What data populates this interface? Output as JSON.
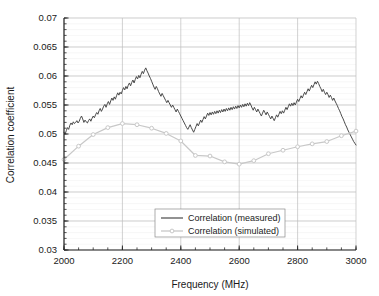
{
  "chart_data": {
    "type": "line",
    "title": "",
    "xlabel": "Frequency (MHz)",
    "ylabel": "Correlation coefficient",
    "xlim": [
      2000,
      3000
    ],
    "ylim": [
      0.03,
      0.07
    ],
    "xticks": [
      2000,
      2200,
      2400,
      2600,
      2800,
      3000
    ],
    "xtick_labels": [
      "2000",
      "2200",
      "2400",
      "2600",
      "2800",
      "3000"
    ],
    "yticks": [
      0.03,
      0.035,
      0.04,
      0.045,
      0.05,
      0.055,
      0.06,
      0.065,
      0.07
    ],
    "ytick_labels": [
      "0.03",
      "0.035",
      "0.04",
      "0.045",
      "0.05",
      "0.055",
      "0.06",
      "0.065",
      "0.07"
    ],
    "grid": true,
    "minor_ticks_y": true,
    "legend_position": "lower center",
    "series": [
      {
        "name": "Correlation (measured)",
        "color": "#4a4a4a",
        "style": "solid",
        "marker": "none",
        "x": [
          2000,
          2004,
          2008,
          2012,
          2016,
          2020,
          2024,
          2028,
          2032,
          2036,
          2040,
          2044,
          2048,
          2052,
          2056,
          2060,
          2064,
          2068,
          2072,
          2076,
          2080,
          2084,
          2088,
          2092,
          2096,
          2100,
          2104,
          2108,
          2112,
          2116,
          2120,
          2124,
          2128,
          2132,
          2136,
          2140,
          2144,
          2148,
          2152,
          2156,
          2160,
          2164,
          2168,
          2172,
          2176,
          2180,
          2184,
          2188,
          2192,
          2196,
          2200,
          2204,
          2208,
          2212,
          2216,
          2220,
          2224,
          2228,
          2232,
          2236,
          2240,
          2244,
          2248,
          2252,
          2256,
          2260,
          2264,
          2268,
          2272,
          2276,
          2280,
          2284,
          2288,
          2292,
          2296,
          2300,
          2304,
          2308,
          2312,
          2316,
          2320,
          2324,
          2328,
          2332,
          2336,
          2340,
          2344,
          2348,
          2352,
          2356,
          2360,
          2364,
          2368,
          2372,
          2376,
          2380,
          2384,
          2388,
          2392,
          2396,
          2400,
          2404,
          2408,
          2412,
          2416,
          2420,
          2424,
          2428,
          2432,
          2436,
          2440,
          2444,
          2448,
          2452,
          2456,
          2460,
          2464,
          2468,
          2472,
          2476,
          2480,
          2484,
          2488,
          2492,
          2496,
          2500,
          2504,
          2508,
          2512,
          2516,
          2520,
          2524,
          2528,
          2532,
          2536,
          2540,
          2544,
          2548,
          2552,
          2556,
          2560,
          2564,
          2568,
          2572,
          2576,
          2580,
          2584,
          2588,
          2592,
          2596,
          2600,
          2604,
          2608,
          2612,
          2616,
          2620,
          2624,
          2628,
          2632,
          2636,
          2640,
          2644,
          2648,
          2652,
          2656,
          2660,
          2664,
          2668,
          2672,
          2676,
          2680,
          2684,
          2688,
          2692,
          2696,
          2700,
          2704,
          2708,
          2712,
          2716,
          2720,
          2724,
          2728,
          2732,
          2736,
          2740,
          2744,
          2748,
          2752,
          2756,
          2760,
          2764,
          2768,
          2772,
          2776,
          2780,
          2784,
          2788,
          2792,
          2796,
          2800,
          2804,
          2808,
          2812,
          2816,
          2820,
          2824,
          2828,
          2832,
          2836,
          2840,
          2844,
          2848,
          2852,
          2856,
          2860,
          2864,
          2868,
          2872,
          2876,
          2880,
          2884,
          2888,
          2892,
          2896,
          2900,
          2904,
          2908,
          2912,
          2916,
          2920,
          2924,
          2928,
          2932,
          2936,
          2940,
          2944,
          2948,
          2952,
          2956,
          2960,
          2964,
          2968,
          2972,
          2976,
          2980,
          2984,
          2988,
          2992,
          2996,
          3000
        ],
        "y": [
          0.0503,
          0.05,
          0.0506,
          0.0511,
          0.0508,
          0.0515,
          0.0519,
          0.0516,
          0.0521,
          0.0518,
          0.052,
          0.0523,
          0.0519,
          0.0522,
          0.0527,
          0.0531,
          0.0526,
          0.052,
          0.0524,
          0.0521,
          0.0519,
          0.0523,
          0.0526,
          0.0522,
          0.0527,
          0.0531,
          0.0528,
          0.0533,
          0.0537,
          0.0534,
          0.054,
          0.0544,
          0.0539,
          0.0543,
          0.0548,
          0.0551,
          0.0546,
          0.0552,
          0.0556,
          0.0551,
          0.0557,
          0.0562,
          0.0558,
          0.0564,
          0.056,
          0.0566,
          0.0571,
          0.0567,
          0.0572,
          0.0569,
          0.0575,
          0.058,
          0.0576,
          0.0582,
          0.0578,
          0.0584,
          0.0588,
          0.0583,
          0.0589,
          0.0593,
          0.0588,
          0.0594,
          0.0599,
          0.0595,
          0.0601,
          0.0597,
          0.0603,
          0.0608,
          0.0604,
          0.061,
          0.0614,
          0.0609,
          0.0605,
          0.06,
          0.0596,
          0.0591,
          0.0586,
          0.0581,
          0.0577,
          0.0582,
          0.0578,
          0.0573,
          0.0569,
          0.0565,
          0.057,
          0.0566,
          0.0562,
          0.0558,
          0.0554,
          0.0558,
          0.0554,
          0.055,
          0.0546,
          0.055,
          0.0546,
          0.0542,
          0.0538,
          0.0543,
          0.0539,
          0.0535,
          0.0531,
          0.0527,
          0.0523,
          0.0519,
          0.0515,
          0.0511,
          0.0508,
          0.0512,
          0.0516,
          0.0511,
          0.0507,
          0.0503,
          0.0508,
          0.0513,
          0.0518,
          0.0514,
          0.0519,
          0.0524,
          0.052,
          0.0525,
          0.053,
          0.0526,
          0.0531,
          0.0536,
          0.0532,
          0.0537,
          0.0533,
          0.0538,
          0.0534,
          0.0539,
          0.0535,
          0.054,
          0.0536,
          0.0541,
          0.0537,
          0.0542,
          0.0538,
          0.0543,
          0.0539,
          0.0544,
          0.054,
          0.0545,
          0.0541,
          0.0546,
          0.0542,
          0.0547,
          0.0543,
          0.0548,
          0.0544,
          0.0549,
          0.0545,
          0.055,
          0.0546,
          0.0551,
          0.0547,
          0.0552,
          0.0548,
          0.0553,
          0.0549,
          0.0554,
          0.055,
          0.0545,
          0.0541,
          0.0546,
          0.0542,
          0.0538,
          0.0543,
          0.0539,
          0.0535,
          0.0531,
          0.0536,
          0.0541,
          0.0537,
          0.0533,
          0.0538,
          0.0534,
          0.053,
          0.0526,
          0.0531,
          0.0527,
          0.0523,
          0.0528,
          0.0533,
          0.0529,
          0.0534,
          0.0539,
          0.0535,
          0.054,
          0.0536,
          0.0541,
          0.0546,
          0.0542,
          0.0547,
          0.0552,
          0.0548,
          0.0553,
          0.0549,
          0.0554,
          0.055,
          0.0555,
          0.056,
          0.0556,
          0.0561,
          0.0566,
          0.0562,
          0.0567,
          0.0572,
          0.0568,
          0.0573,
          0.0578,
          0.0574,
          0.0579,
          0.0584,
          0.058,
          0.0585,
          0.059,
          0.0586,
          0.0591,
          0.0587,
          0.0582,
          0.0578,
          0.0573,
          0.0577,
          0.0572,
          0.0568,
          0.0572,
          0.0568,
          0.0563,
          0.0567,
          0.0563,
          0.0558,
          0.0562,
          0.0557,
          0.0553,
          0.0549,
          0.0544,
          0.054,
          0.0535,
          0.053,
          0.0526,
          0.0521,
          0.0516,
          0.0512,
          0.0507,
          0.0503,
          0.0499,
          0.0495,
          0.0491,
          0.0487,
          0.0484,
          0.0481
        ]
      },
      {
        "name": "Correlation (simulated)",
        "color": "#c8c8c8",
        "style": "solid",
        "marker": "circle",
        "x": [
          2000,
          2050,
          2100,
          2150,
          2200,
          2250,
          2300,
          2350,
          2400,
          2450,
          2500,
          2550,
          2600,
          2650,
          2700,
          2750,
          2800,
          2850,
          2900,
          2950,
          3000
        ],
        "y": [
          0.0456,
          0.0479,
          0.0499,
          0.0511,
          0.0518,
          0.0516,
          0.051,
          0.0501,
          0.0488,
          0.0463,
          0.0462,
          0.0452,
          0.0448,
          0.0454,
          0.0466,
          0.0472,
          0.0478,
          0.0483,
          0.0487,
          0.0497,
          0.0505
        ]
      }
    ]
  },
  "legend": {
    "entries": [
      {
        "label": "Correlation (measured)"
      },
      {
        "label": "Correlation (simulated)"
      }
    ]
  },
  "colors": {
    "measured_line": "#4a4a4a",
    "simulated_line": "#c8c8c8",
    "grid_major": "#bfbfbf",
    "grid_minor": "#eeeeee",
    "axis": "#555555",
    "text": "#1a1a1a",
    "background": "#ffffff"
  }
}
